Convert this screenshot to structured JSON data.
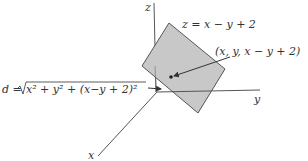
{
  "diagram": {
    "axes": {
      "z_label": "z",
      "y_label": "y",
      "x_label": "x"
    },
    "plane_label": "z = x − y + 2",
    "point_label": "(x, y, x − y + 2)",
    "distance_label_prefix": "d = ",
    "distance_label_radicand": "x² + y² + (x−y + 2)²",
    "colors": {
      "plane_fill": "#c8c8c8",
      "plane_stroke": "#555555",
      "axis": "#555555",
      "text": "#333333"
    }
  }
}
